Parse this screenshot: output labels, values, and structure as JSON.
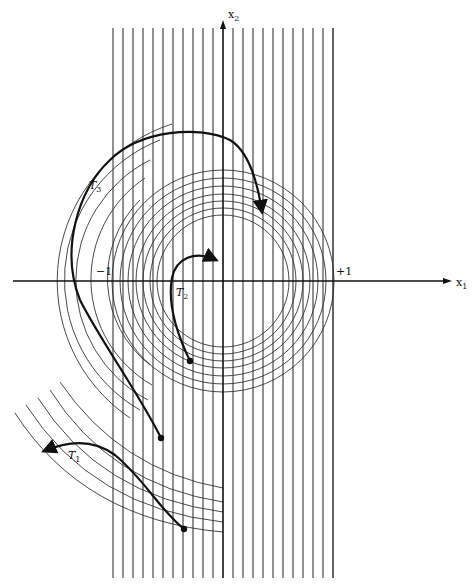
{
  "diagram": {
    "axes": {
      "x_label": "x",
      "x_sub": "1",
      "y_label": "x",
      "y_sub": "2",
      "tick_neg": "−1",
      "tick_pos": "+1"
    },
    "trajectories": [
      {
        "label": "T",
        "sub": "1"
      },
      {
        "label": "T",
        "sub": "2"
      },
      {
        "label": "T",
        "sub": "3"
      }
    ],
    "colors": {
      "ink": "#111111",
      "thin": "#333333",
      "background": "#ffffff"
    }
  }
}
